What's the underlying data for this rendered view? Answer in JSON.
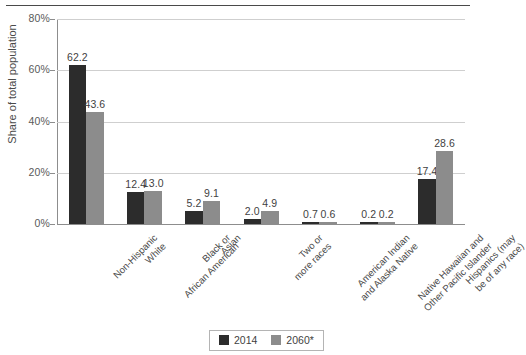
{
  "chart_data": {
    "type": "bar",
    "title": "",
    "subtitle": "",
    "xlabel": "",
    "ylabel": "Share of total population",
    "ylim": [
      0,
      80
    ],
    "ytick_labels": [
      "0%",
      "20%",
      "40%",
      "60%",
      "80%"
    ],
    "ytick_values": [
      0,
      20,
      40,
      60,
      80
    ],
    "grid": "horizontal",
    "legend_position": "bottom-center",
    "categories": [
      "Non-Hispanic\nWhite",
      "Black or\nAfrican American",
      "Asian",
      "Two or\nmore races",
      "American Indian\nand Alaska Native",
      "Native Hawaiian and\nOther Pacific Islander",
      "Hispanics (may\nbe of any race)"
    ],
    "series": [
      {
        "name": "2014",
        "color": "#2c2c2c",
        "values": [
          62.2,
          12.4,
          5.2,
          2.0,
          0.7,
          0.2,
          17.4
        ],
        "value_labels": [
          "62.2",
          "12.4",
          "5.2",
          "2.0",
          "0.7",
          "0.2",
          "17.4"
        ]
      },
      {
        "name": "2060*",
        "color": "#8c8c8c",
        "values": [
          43.6,
          13.0,
          9.1,
          4.9,
          0.6,
          0.2,
          28.6
        ],
        "value_labels": [
          "43.6",
          "13.0",
          "9.1",
          "4.9",
          "0.6",
          "0.2",
          "28.6"
        ]
      }
    ]
  },
  "legend": {
    "items": [
      {
        "label": "2014",
        "color": "#2c2c2c"
      },
      {
        "label": "2060*",
        "color": "#8c8c8c"
      }
    ]
  }
}
